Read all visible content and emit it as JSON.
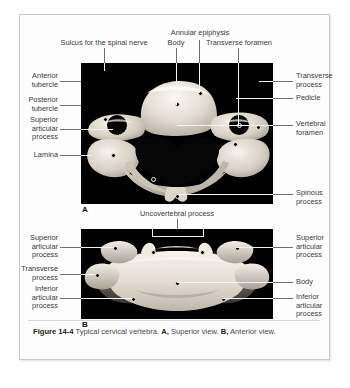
{
  "figure": {
    "number": "Figure 14-4",
    "caption_text": " Typical cervical vertebra. ",
    "part_a_letter": "A,",
    "part_a_view": " Superior view.",
    "part_b_letter": "B,",
    "part_b_view": " Anterior view.",
    "panel_a_marker": "A",
    "panel_b_marker": "B"
  },
  "panel_a": {
    "title": "Superior view",
    "labels": {
      "sulcus_spinal_nerve": "Sulcus for the spinal nerve",
      "body": "Body",
      "annular_epiphysis": "Annular epiphysis",
      "transverse_foramen": "Transverse foramen",
      "anterior_tubercle": "Anterior\ntubercle",
      "posterior_tubercle": "Posterior\ntubercle",
      "superior_articular_process": "Superior\narticular\nprocess",
      "lamina": "Lamina",
      "transverse_process": "Transverse\nprocess",
      "pedicle": "Pedicle",
      "vertebral_foramen": "Vertebral\nforamen",
      "spinous_process": "Spinous\nprocess"
    }
  },
  "panel_b": {
    "title": "Anterior view",
    "labels": {
      "uncovertebral_process": "Uncovertebral process",
      "superior_articular_process_left": "Superior\narticular\nprocess",
      "transverse_process": "Transverse\nprocess",
      "inferior_articular_process_left": "Inferior\narticular\nprocess",
      "superior_articular_process_right": "Superior\narticular\nprocess",
      "body": "Body",
      "inferior_articular_process_right": "Inferior\narticular\nprocess"
    }
  },
  "colors": {
    "card_background": "#fdfdfd",
    "card_border": "#c9c9c9",
    "photo_background": "#000000",
    "label_text": "#3b3b3b",
    "leader_line": "#6e6e6e",
    "leader_line_light": "#f2f2f2",
    "caption_text": "#4a4a4a",
    "bone_light": "#f0ece5",
    "bone_mid": "#cfc8bd",
    "bone_shadow": "#8e877d"
  }
}
